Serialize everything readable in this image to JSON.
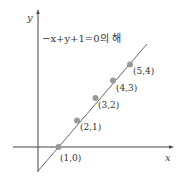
{
  "diagram": {
    "title": "−x+y+1=0의 해",
    "axes": {
      "x_label": "x",
      "y_label": "y"
    },
    "equation": "-x + y + 1 = 0",
    "points": [
      {
        "label": "(1,0)",
        "x": 1,
        "y": 0
      },
      {
        "label": "(2,1)",
        "x": 2,
        "y": 1
      },
      {
        "label": "(3,2)",
        "x": 3,
        "y": 2
      },
      {
        "label": "(4,3)",
        "x": 4,
        "y": 3
      },
      {
        "label": "(5,4)",
        "x": 5,
        "y": 4
      }
    ],
    "colors": {
      "axis": "#444444",
      "line": "#555555",
      "point": "#999999"
    }
  }
}
